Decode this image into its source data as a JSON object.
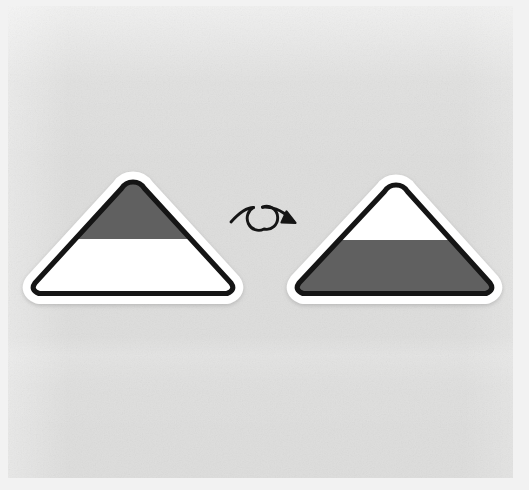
{
  "canvas": {
    "width": 529,
    "height": 490,
    "background_color": "#f2f2f2",
    "paper_color": "#dededd",
    "paper_texture": "light-gray-noise-paper"
  },
  "scene": {
    "title": "Triangle flip transformation",
    "description": "Two rounded triangles side by side with a curved looping arrow between them indicating a vertical flip of the fill pattern."
  },
  "shapes": {
    "stroke_color": "#151515",
    "halo_color": "#ffffff",
    "fill_dark": "#606060",
    "fill_light": "#ffffff",
    "stroke_width": 5,
    "halo_width": 20,
    "corner_radius": 11,
    "left_triangle": {
      "name": "source-triangle",
      "apex": {
        "x": 133,
        "y": 186
      },
      "base_left": {
        "x": 38,
        "y": 290
      },
      "base_right": {
        "x": 228,
        "y": 290
      },
      "divider_y": 239,
      "top_band_color": "#606060",
      "bottom_band_color": "#ffffff",
      "top_band_label": "dark",
      "bottom_band_label": "light"
    },
    "right_triangle": {
      "name": "result-triangle",
      "apex": {
        "x": 396,
        "y": 189
      },
      "base_left": {
        "x": 302,
        "y": 290
      },
      "base_right": {
        "x": 487,
        "y": 290
      },
      "divider_y": 240,
      "top_band_color": "#ffffff",
      "bottom_band_color": "#606060",
      "top_band_label": "light",
      "bottom_band_label": "dark"
    },
    "arrow": {
      "name": "loop-arrow",
      "color": "#151515",
      "stroke_width": 3,
      "start": {
        "x": 231,
        "y": 222
      },
      "end": {
        "x": 295,
        "y": 219
      },
      "loop_center": {
        "x": 262,
        "y": 218
      },
      "loop_radius": 11,
      "direction": "left-to-right",
      "meaning": "flip"
    }
  }
}
